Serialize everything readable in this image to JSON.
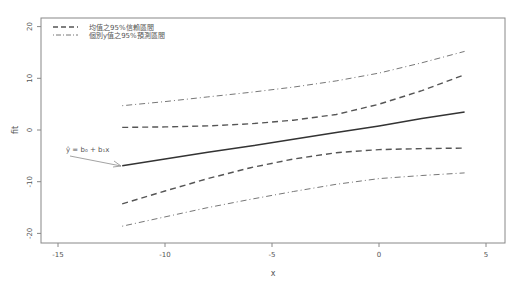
{
  "chart_data": {
    "type": "line",
    "title": "",
    "xlabel": "x",
    "ylabel": "fit",
    "xlim": [
      -16,
      6
    ],
    "ylim": [
      -21,
      22
    ],
    "xticks": [
      -15,
      -10,
      -5,
      0,
      5
    ],
    "yticks": [
      -20,
      -10,
      0,
      10,
      20
    ],
    "grid": false,
    "legend_position": "top-left",
    "x": [
      -12,
      -10,
      -8,
      -6,
      -4,
      -2,
      0,
      2,
      4
    ],
    "series": [
      {
        "name": "fit",
        "style": "solid",
        "values": [
          -6.9,
          -5.6,
          -4.3,
          -3.1,
          -1.8,
          -0.5,
          0.8,
          2.2,
          3.5
        ]
      },
      {
        "name": "均值之95%信賴區間 (upper)",
        "style": "dashed",
        "values": [
          0.5,
          0.6,
          0.8,
          1.2,
          1.9,
          3.0,
          5.0,
          7.6,
          10.7
        ]
      },
      {
        "name": "均值之95%信賴區間 (lower)",
        "style": "dashed",
        "values": [
          -14.3,
          -11.8,
          -9.4,
          -7.3,
          -5.6,
          -4.4,
          -3.8,
          -3.6,
          -3.5
        ]
      },
      {
        "name": "個別y值之95%預測區間 (upper)",
        "style": "dotdash",
        "values": [
          4.7,
          5.5,
          6.4,
          7.3,
          8.3,
          9.5,
          11.0,
          13.0,
          15.2
        ]
      },
      {
        "name": "個別y值之95%預測區間 (lower)",
        "style": "dotdash",
        "values": [
          -18.6,
          -16.8,
          -15.0,
          -13.4,
          -11.9,
          -10.5,
          -9.4,
          -8.8,
          -8.3
        ]
      }
    ],
    "legend": [
      {
        "label": "均值之95%信賴區間",
        "style": "dashed"
      },
      {
        "label": "個別y值之95%預測區間",
        "style": "dotdash"
      }
    ],
    "annotation": {
      "text": "ŷ = b₀ + b₁x",
      "arrow_to": [
        -12,
        -6.9
      ]
    }
  }
}
